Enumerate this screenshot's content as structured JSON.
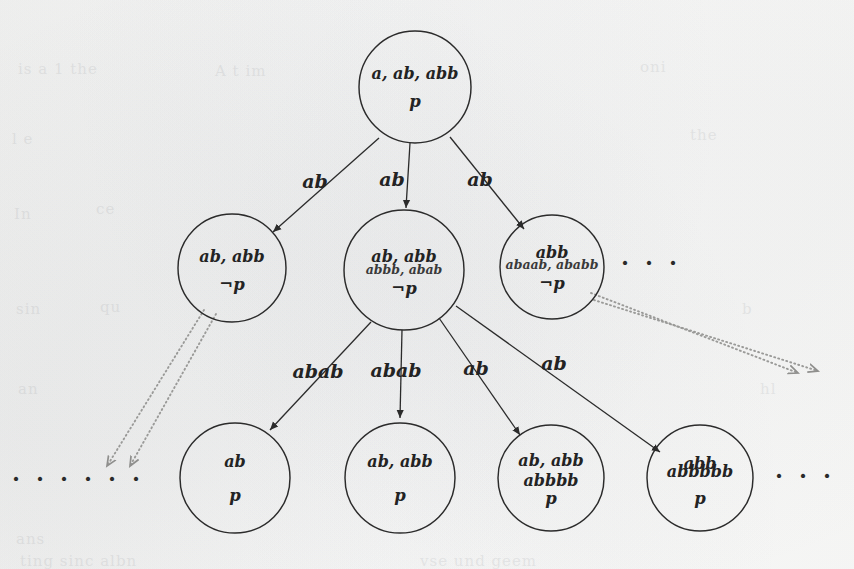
{
  "figure": {
    "kind": "search-tree-diagram",
    "background_color": "#fbfbfa",
    "ink_color": "#2b2b2b",
    "dotted_color": "#9a9a98"
  },
  "nodes": [
    {
      "id": "root",
      "data_name": "tree-node-root",
      "cx": 415,
      "cy": 87,
      "r": 56,
      "lines": [
        {
          "text": "a, ab, abb",
          "style": "main",
          "dy": -8
        },
        {
          "text": "p",
          "style": "prop",
          "dy": 20
        }
      ]
    },
    {
      "id": "n1",
      "data_name": "tree-node-level2-1",
      "cx": 232,
      "cy": 268,
      "r": 54,
      "lines": [
        {
          "text": "ab, abb",
          "style": "main",
          "dy": -6
        },
        {
          "text": "¬p",
          "style": "prop",
          "dy": 22
        }
      ]
    },
    {
      "id": "n2",
      "data_name": "tree-node-level2-2",
      "cx": 404,
      "cy": 270,
      "r": 60,
      "lines": [
        {
          "text": "ab, abb",
          "style": "main",
          "dy": -8
        },
        {
          "text": "abbb, abab",
          "style": "sub",
          "dy": 4
        },
        {
          "text": "¬p",
          "style": "prop",
          "dy": 24
        }
      ]
    },
    {
      "id": "n3",
      "data_name": "tree-node-level2-3",
      "cx": 552,
      "cy": 267,
      "r": 52,
      "lines": [
        {
          "text": "abb",
          "style": "main",
          "dy": -9
        },
        {
          "text": "abaab, ababb",
          "style": "sub",
          "dy": 2
        },
        {
          "text": "¬p",
          "style": "prop",
          "dy": 22
        }
      ]
    },
    {
      "id": "m1",
      "data_name": "tree-node-level3-1",
      "cx": 235,
      "cy": 478,
      "r": 55,
      "lines": [
        {
          "text": "ab",
          "style": "main",
          "dy": -11
        },
        {
          "text": "p",
          "style": "prop",
          "dy": 23
        }
      ]
    },
    {
      "id": "m2",
      "data_name": "tree-node-level3-2",
      "cx": 400,
      "cy": 478,
      "r": 55,
      "lines": [
        {
          "text": "ab, abb",
          "style": "main",
          "dy": -11
        },
        {
          "text": "p",
          "style": "prop",
          "dy": 23
        }
      ]
    },
    {
      "id": "m3",
      "data_name": "tree-node-level3-3",
      "cx": 551,
      "cy": 478,
      "r": 53,
      "lines": [
        {
          "text": "ab, abb",
          "style": "main",
          "dy": -12
        },
        {
          "text": "abbbb",
          "style": "main",
          "dy": 8
        },
        {
          "text": "p",
          "style": "prop",
          "dy": 26
        }
      ]
    },
    {
      "id": "m4",
      "data_name": "tree-node-level3-4",
      "cx": 700,
      "cy": 478,
      "r": 53,
      "lines": [
        {
          "text": "abb",
          "style": "main",
          "dy": -9
        },
        {
          "text": "abbbbb",
          "style": "main",
          "dy": -1
        },
        {
          "text": "p",
          "style": "prop",
          "dy": 26
        }
      ]
    }
  ],
  "edges": [
    {
      "data_name": "tree-edge-root-to-level2-1",
      "label": "ab",
      "label_x": 315,
      "label_y": 188,
      "x1": 379,
      "y1": 138,
      "x2": 273,
      "y2": 232
    },
    {
      "data_name": "tree-edge-root-to-level2-2",
      "label": "ab",
      "label_x": 392,
      "label_y": 186,
      "x1": 410,
      "y1": 143,
      "x2": 406,
      "y2": 208
    },
    {
      "data_name": "tree-edge-root-to-level2-3",
      "label": "ab",
      "label_x": 480,
      "label_y": 186,
      "x1": 450,
      "y1": 137,
      "x2": 524,
      "y2": 229
    },
    {
      "data_name": "tree-edge-level2-2-to-level3-1",
      "label": "abab",
      "label_x": 318,
      "label_y": 378,
      "x1": 371,
      "y1": 322,
      "x2": 270,
      "y2": 430
    },
    {
      "data_name": "tree-edge-level2-2-to-level3-2",
      "label": "abab",
      "label_x": 396,
      "label_y": 377,
      "x1": 402,
      "y1": 330,
      "x2": 400,
      "y2": 418
    },
    {
      "data_name": "tree-edge-level2-2-to-level3-3",
      "label": "ab",
      "label_x": 476,
      "label_y": 375,
      "x1": 439,
      "y1": 318,
      "x2": 520,
      "y2": 435
    },
    {
      "data_name": "tree-edge-level2-2-to-level3-4",
      "label": "ab",
      "label_x": 554,
      "label_y": 370,
      "x1": 456,
      "y1": 306,
      "x2": 660,
      "y2": 452
    }
  ],
  "dotted_edges": [
    {
      "data_name": "dotted-edge-level2-1-left-a",
      "x1": 204,
      "y1": 310,
      "x2": 107,
      "y2": 466
    },
    {
      "data_name": "dotted-edge-level2-1-left-b",
      "x1": 216,
      "y1": 314,
      "x2": 130,
      "y2": 466
    },
    {
      "data_name": "dotted-edge-level2-3-right-a",
      "x1": 591,
      "y1": 293,
      "x2": 798,
      "y2": 373
    },
    {
      "data_name": "dotted-edge-level2-3-right-b",
      "x1": 594,
      "y1": 300,
      "x2": 818,
      "y2": 371
    }
  ],
  "ellipses": [
    {
      "data_name": "ellipsis-level2-right",
      "text": "· · ·",
      "x": 651,
      "y": 271
    },
    {
      "data_name": "ellipsis-level3-left",
      "text": "· · · · · ·",
      "x": 78,
      "y": 487
    },
    {
      "data_name": "ellipsis-level3-right",
      "text": "· · ·",
      "x": 805,
      "y": 484
    }
  ],
  "ghost_marks": [
    {
      "text": "is a  1  the",
      "x": 18,
      "y": 60
    },
    {
      "text": "A  t  im",
      "x": 215,
      "y": 62
    },
    {
      "text": "oni",
      "x": 640,
      "y": 58
    },
    {
      "text": "l e",
      "x": 12,
      "y": 130
    },
    {
      "text": "the",
      "x": 690,
      "y": 126
    },
    {
      "text": "In",
      "x": 14,
      "y": 205
    },
    {
      "text": "ce",
      "x": 96,
      "y": 200
    },
    {
      "text": "sin",
      "x": 16,
      "y": 300
    },
    {
      "text": "qu",
      "x": 100,
      "y": 298
    },
    {
      "text": "b",
      "x": 742,
      "y": 300
    },
    {
      "text": "an",
      "x": 18,
      "y": 380
    },
    {
      "text": "hl",
      "x": 760,
      "y": 380
    },
    {
      "text": "ans",
      "x": 16,
      "y": 530
    },
    {
      "text": "ting  sinc   albn",
      "x": 20,
      "y": 552
    },
    {
      "text": "vse  und  geem",
      "x": 420,
      "y": 552
    }
  ]
}
